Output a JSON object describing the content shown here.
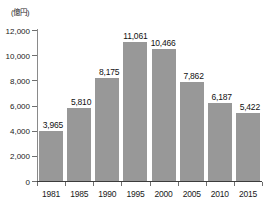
{
  "chart_data": {
    "type": "bar",
    "title": "",
    "subtitle": "",
    "unit_label": "(億円)",
    "xlabel": "",
    "ylabel": "",
    "categories": [
      "1981",
      "1985",
      "1990",
      "1995",
      "2000",
      "2005",
      "2010",
      "2015"
    ],
    "values": [
      3965,
      5810,
      8175,
      11061,
      10466,
      7862,
      6187,
      5422
    ],
    "value_labels": [
      "3,965",
      "5,810",
      "8,175",
      "11,061",
      "10,466",
      "7,862",
      "6,187",
      "5,422"
    ],
    "ylim": [
      0,
      12000
    ],
    "ytick_values": [
      0,
      2000,
      4000,
      6000,
      8000,
      10000,
      12000
    ],
    "ytick_labels": [
      "0",
      "2,000",
      "4,000",
      "6,000",
      "8,000",
      "10,000",
      "12,000"
    ],
    "grid": false,
    "legend": null,
    "legend_position": "none",
    "bar_color": "#989898",
    "axis_color": "#3c3c3c",
    "background_color": "#ffffff",
    "text_color": "#1a1a1a"
  }
}
